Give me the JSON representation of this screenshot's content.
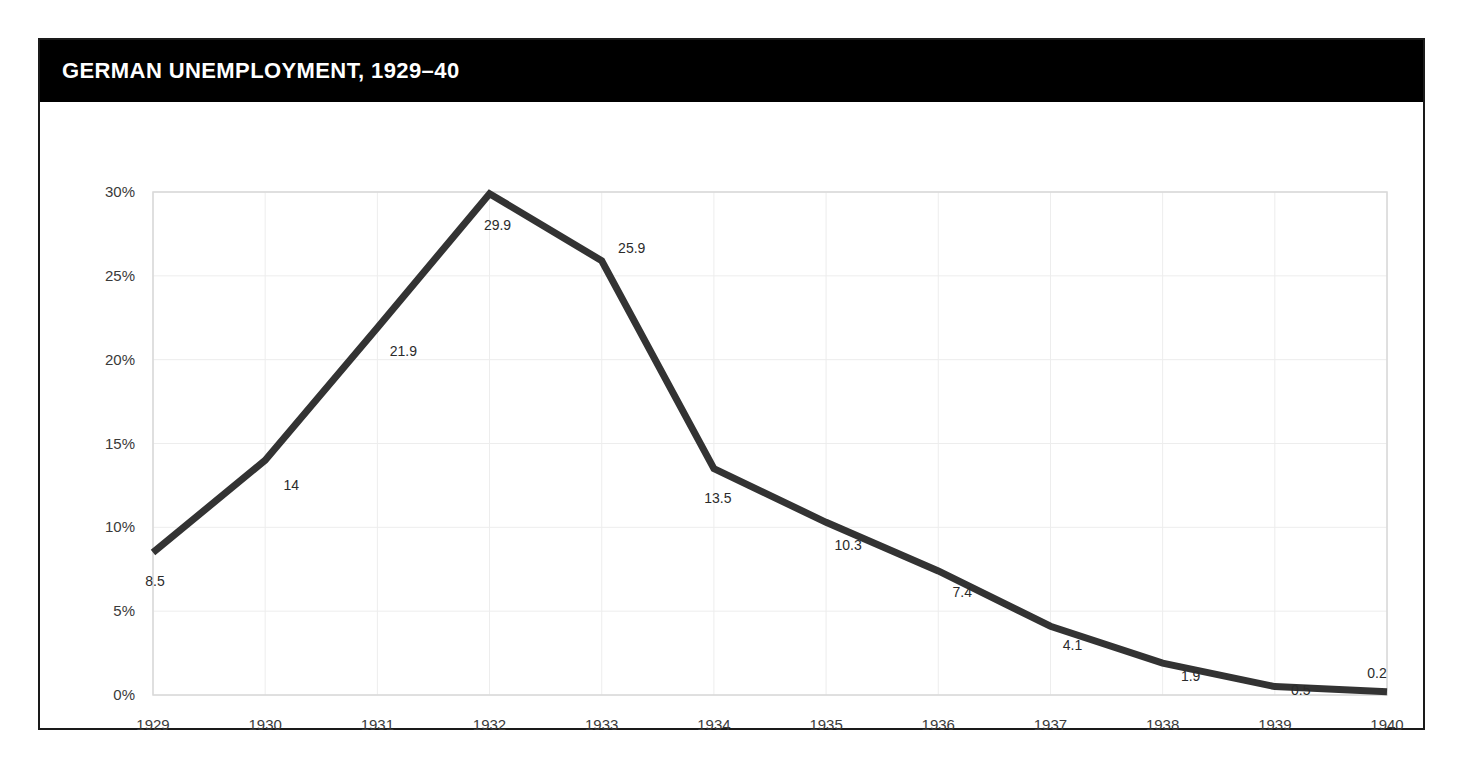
{
  "card": {
    "title": "GERMAN UNEMPLOYMENT, 1929–40",
    "border_color": "#1a1a1a",
    "title_bar_color": "#000000",
    "title_text_color": "#ffffff",
    "background_color": "#ffffff"
  },
  "chart_data": {
    "type": "line",
    "title": "GERMAN UNEMPLOYMENT, 1929–40",
    "xlabel": "",
    "ylabel": "",
    "categories": [
      "1929",
      "1930",
      "1931",
      "1932",
      "1933",
      "1934",
      "1935",
      "1936",
      "1937",
      "1938",
      "1939",
      "1940"
    ],
    "values": [
      8.5,
      14,
      21.9,
      29.9,
      25.9,
      13.5,
      10.3,
      7.4,
      4.1,
      1.9,
      0.5,
      0.2
    ],
    "point_labels": [
      "8.5",
      "14",
      "21.9",
      "29.9",
      "25.9",
      "13.5",
      "10.3",
      "7.4",
      "4.1",
      "1.9",
      "0.5",
      "0.2"
    ],
    "ylim": [
      0,
      30
    ],
    "ytick_values": [
      0,
      5,
      10,
      15,
      20,
      25,
      30
    ],
    "ytick_labels": [
      "0%",
      "5%",
      "10%",
      "15%",
      "20%",
      "25%",
      "30%"
    ],
    "grid": true,
    "legend": false,
    "series_color": "#333333",
    "gridline_color": "#ededed",
    "unit": "percent"
  }
}
